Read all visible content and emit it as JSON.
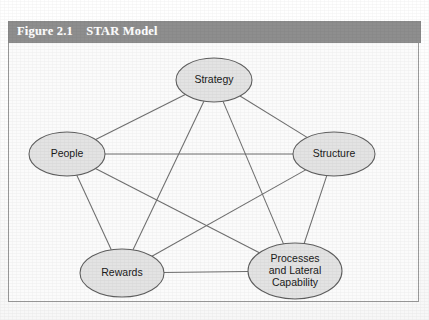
{
  "figure": {
    "caption_number": "Figure 2.1",
    "caption_title": "STAR Model",
    "caption_full": "Figure 2.1    STAR Model",
    "caption_bar_color": "#8e8e8e",
    "caption_text_color": "#ffffff",
    "panel_border_color": "#9a9a9a",
    "panel_background": "#fbfbfb"
  },
  "chart_data": {
    "type": "diagram",
    "diagram_kind": "node-link pentagon (complete graph K5)",
    "title": "STAR Model",
    "node_fill_color": "#e3e3e3",
    "node_stroke_color": "#5e5e5e",
    "edge_color": "#6f6f6f",
    "nodes": [
      {
        "id": "strategy",
        "label": "Strategy",
        "lines": [
          "Strategy"
        ],
        "cx": 205,
        "cy": 37,
        "rx": 38,
        "ry": 22
      },
      {
        "id": "people",
        "label": "People",
        "lines": [
          "People"
        ],
        "cx": 58,
        "cy": 111,
        "rx": 38,
        "ry": 22
      },
      {
        "id": "structure",
        "label": "Structure",
        "lines": [
          "Structure"
        ],
        "cx": 325,
        "cy": 111,
        "rx": 41,
        "ry": 22
      },
      {
        "id": "rewards",
        "label": "Rewards",
        "lines": [
          "Rewards"
        ],
        "cx": 113,
        "cy": 230,
        "rx": 42,
        "ry": 24
      },
      {
        "id": "processes",
        "label": "Processes and Lateral Capability",
        "lines": [
          "Processes",
          "and Lateral",
          "Capability"
        ],
        "cx": 286,
        "cy": 228,
        "rx": 47,
        "ry": 28
      }
    ],
    "edges": [
      {
        "from": "strategy",
        "to": "people"
      },
      {
        "from": "strategy",
        "to": "structure"
      },
      {
        "from": "strategy",
        "to": "rewards"
      },
      {
        "from": "strategy",
        "to": "processes"
      },
      {
        "from": "people",
        "to": "structure"
      },
      {
        "from": "people",
        "to": "rewards"
      },
      {
        "from": "people",
        "to": "processes"
      },
      {
        "from": "structure",
        "to": "rewards"
      },
      {
        "from": "structure",
        "to": "processes"
      },
      {
        "from": "rewards",
        "to": "processes"
      }
    ]
  }
}
